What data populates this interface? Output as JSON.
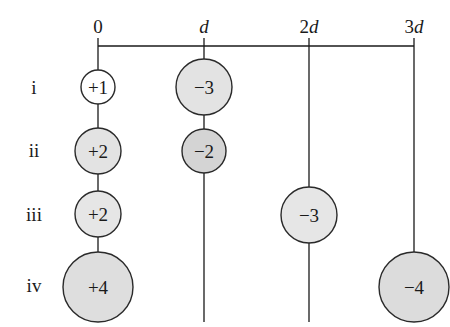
{
  "diagram": {
    "columns": [
      {
        "label_num": "0",
        "label_var": "",
        "x": 98
      },
      {
        "label_num": "",
        "label_var": "d",
        "x": 204
      },
      {
        "label_num": "2",
        "label_var": "d",
        "x": 309
      },
      {
        "label_num": "3",
        "label_var": "d",
        "x": 414
      }
    ],
    "rows": [
      {
        "label": "i",
        "y": 87
      },
      {
        "label": "ii",
        "y": 150
      },
      {
        "label": "iii",
        "y": 214
      },
      {
        "label": "iv",
        "y": 285
      }
    ],
    "charges": [
      {
        "row": "i",
        "column": "0",
        "value": "+1",
        "radius": 17,
        "fill": "#ffffff"
      },
      {
        "row": "i",
        "column": "d",
        "value": "−3",
        "radius": 28,
        "fill": "#e3e3e3"
      },
      {
        "row": "ii",
        "column": "0",
        "value": "+2",
        "radius": 23,
        "fill": "#e3e3e3"
      },
      {
        "row": "ii",
        "column": "d",
        "value": "−2",
        "radius": 22,
        "fill": "#d4d4d4"
      },
      {
        "row": "iii",
        "column": "0",
        "value": "+2",
        "radius": 23,
        "fill": "#e6e6e6"
      },
      {
        "row": "iii",
        "column": "2d",
        "value": "−3",
        "radius": 28,
        "fill": "#e6e6e6"
      },
      {
        "row": "iv",
        "column": "0",
        "value": "+4",
        "radius": 35,
        "fill": "#dedede"
      },
      {
        "row": "iv",
        "column": "3d",
        "value": "−4",
        "radius": 35,
        "fill": "#dcdcdc"
      }
    ],
    "colors": {
      "line": "#1a1a1a",
      "light_fill": "#e3e3e3",
      "background": "#ffffff"
    }
  }
}
